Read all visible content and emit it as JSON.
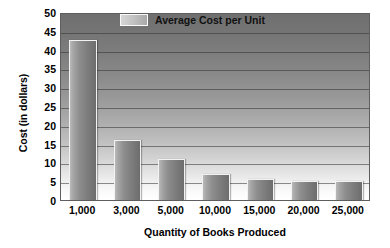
{
  "chart_data": {
    "type": "bar",
    "title": "",
    "categories": [
      "1,000",
      "3,000",
      "5,000",
      "10,000",
      "15,000",
      "20,000",
      "25,000"
    ],
    "values": [
      42.5,
      16,
      11,
      7,
      5.5,
      5,
      5
    ],
    "series": [
      {
        "name": "Average Cost per Unit",
        "values": [
          42.5,
          16,
          11,
          7,
          5.5,
          5,
          5
        ]
      }
    ],
    "xlabel": "Quantity of Books Produced",
    "ylabel": "Cost (in dollars)",
    "ylim": [
      0,
      50
    ],
    "ytick_labels": [
      "0",
      "5",
      "10",
      "15",
      "20",
      "25",
      "30",
      "35",
      "40",
      "45",
      "50"
    ],
    "ytick_values": [
      0,
      5,
      10,
      15,
      20,
      25,
      30,
      35,
      40,
      45,
      50
    ],
    "grid": true,
    "legend_position": "top-center",
    "legend": [
      "Average Cost per Unit"
    ],
    "colors": {
      "bar_light": "#b9b9b9",
      "bar_dark": "#6d6d6d",
      "bar_outline": "#f2f2f2",
      "plot_top": "#6f6f6f",
      "plot_bottom": "#ffffff",
      "gridline": "#323232",
      "text": "#000000",
      "background": "#ffffff"
    }
  }
}
